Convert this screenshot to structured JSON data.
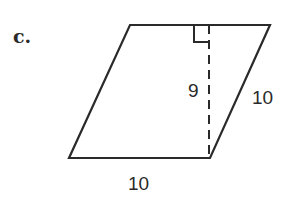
{
  "problem": {
    "label": "c."
  },
  "figure": {
    "shape": "parallelogram",
    "labels": {
      "base": "10",
      "height": "9",
      "side": "10"
    },
    "right_angle_marker": true,
    "colors": {
      "stroke": "#2a2a2a",
      "background": "#ffffff"
    }
  }
}
